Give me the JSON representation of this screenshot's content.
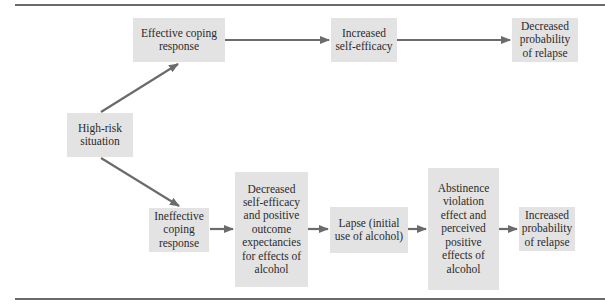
{
  "diagram": {
    "type": "flowchart",
    "colors": {
      "box_fill": "#e3e3e3",
      "arrow": "#6b6b6b",
      "rule": "#6b6b6b",
      "text": "#2b2b2b"
    },
    "nodes": {
      "high_risk": "High-risk situation",
      "effective_coping": "Effective coping response",
      "increased_self_efficacy": "Increased self-efficacy",
      "decreased_probability": "Decreased probability of relapse",
      "ineffective_coping": "Ineffective coping response",
      "decreased_self_efficacy": "Decreased self-efficacy and positive outcome expectancies for effects of alcohol",
      "lapse": "Lapse (initial use of alcohol)",
      "abstinence_violation": "Abstinence violation effect and perceived positive effects of alcohol",
      "increased_probability": "Increased probability of relapse"
    },
    "edges": [
      [
        "high_risk",
        "effective_coping"
      ],
      [
        "effective_coping",
        "increased_self_efficacy"
      ],
      [
        "increased_self_efficacy",
        "decreased_probability"
      ],
      [
        "high_risk",
        "ineffective_coping"
      ],
      [
        "ineffective_coping",
        "decreased_self_efficacy"
      ],
      [
        "decreased_self_efficacy",
        "lapse"
      ],
      [
        "lapse",
        "abstinence_violation"
      ],
      [
        "abstinence_violation",
        "increased_probability"
      ]
    ]
  }
}
